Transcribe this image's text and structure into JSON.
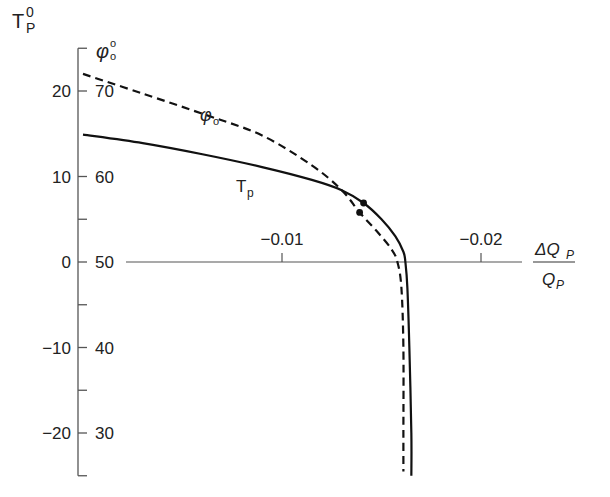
{
  "chart_data": {
    "type": "line",
    "title": "",
    "xlabel": {
      "numerator": "ΔQ",
      "numerator_sub": "P",
      "denominator": "Q",
      "denominator_sub": "P"
    },
    "ylabel_left": {
      "base": "T",
      "sub": "P",
      "sup": "0"
    },
    "ylabel_right": {
      "base": "φ",
      "sub": "o",
      "sup": "o"
    },
    "x_ticks": [
      {
        "value": -0.01,
        "label": "−0.01"
      },
      {
        "value": -0.02,
        "label": "−0.02"
      }
    ],
    "y_left_ticks": [
      {
        "value": 20,
        "label": "20"
      },
      {
        "value": 10,
        "label": "10"
      },
      {
        "value": 0,
        "label": "0"
      },
      {
        "value": -10,
        "label": "−10"
      },
      {
        "value": -20,
        "label": "−20"
      }
    ],
    "y_right_ticks": [
      {
        "value": 20,
        "label": "70"
      },
      {
        "value": 10,
        "label": "60"
      },
      {
        "value": 0,
        "label": "50"
      },
      {
        "value": -10,
        "label": "40"
      },
      {
        "value": -20,
        "label": "30"
      }
    ],
    "y_minor_ticks": [
      25,
      5,
      -5,
      -15,
      -25
    ],
    "xlim": [
      0,
      -0.022
    ],
    "ylim": [
      -25,
      25
    ],
    "grid": false,
    "series": [
      {
        "name": "Tp",
        "label": "T",
        "label_sub": "p",
        "style": "solid",
        "points": [
          [
            0,
            14.9
          ],
          [
            -0.003,
            13.9
          ],
          [
            -0.006,
            12.6
          ],
          [
            -0.009,
            11.1
          ],
          [
            -0.0115,
            9.6
          ],
          [
            -0.013,
            8.4
          ],
          [
            -0.0141,
            6.9
          ],
          [
            -0.015,
            5.0
          ],
          [
            -0.0157,
            3.0
          ],
          [
            -0.0161,
            1.2
          ],
          [
            -0.0162,
            0
          ],
          [
            -0.0163,
            -3
          ],
          [
            -0.0164,
            -10
          ],
          [
            -0.0165,
            -20
          ],
          [
            -0.0165,
            -25
          ]
        ],
        "marker": {
          "x": -0.0141,
          "y": 6.9
        }
      },
      {
        "name": "φo",
        "label": "φ",
        "label_sub": "o",
        "style": "dashed",
        "points": [
          [
            0,
            22
          ],
          [
            -0.003,
            19.7
          ],
          [
            -0.0063,
            17.1
          ],
          [
            -0.009,
            14.8
          ],
          [
            -0.0115,
            11.3
          ],
          [
            -0.013,
            8.4
          ],
          [
            -0.0139,
            5.8
          ],
          [
            -0.0148,
            3.5
          ],
          [
            -0.0155,
            1.5
          ],
          [
            -0.0158,
            0
          ],
          [
            -0.016,
            -3
          ],
          [
            -0.0161,
            -10
          ],
          [
            -0.0161,
            -20
          ],
          [
            -0.0161,
            -24.5
          ]
        ],
        "marker": {
          "x": -0.0139,
          "y": 5.8
        }
      }
    ]
  }
}
